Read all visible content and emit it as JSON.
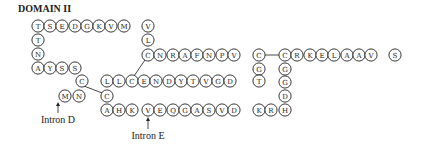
{
  "title": "DOMAIN II",
  "radius": 6.1,
  "residues": [
    {
      "aa": "T",
      "x": 38,
      "y": 26
    },
    {
      "aa": "S",
      "x": 50,
      "y": 26
    },
    {
      "aa": "E",
      "x": 62,
      "y": 26
    },
    {
      "aa": "D",
      "x": 75,
      "y": 26
    },
    {
      "aa": "G",
      "x": 87,
      "y": 26
    },
    {
      "aa": "K",
      "x": 99,
      "y": 26
    },
    {
      "aa": "V",
      "x": 111,
      "y": 26
    },
    {
      "aa": "M",
      "x": 124,
      "y": 26
    },
    {
      "aa": "V",
      "x": 148,
      "y": 26
    },
    {
      "aa": "T",
      "x": 38,
      "y": 40
    },
    {
      "aa": "N",
      "x": 38,
      "y": 54
    },
    {
      "aa": "A",
      "x": 38,
      "y": 68
    },
    {
      "aa": "Y",
      "x": 50,
      "y": 68
    },
    {
      "aa": "S",
      "x": 62,
      "y": 68
    },
    {
      "aa": "S",
      "x": 75,
      "y": 68
    },
    {
      "aa": "C",
      "x": 82,
      "y": 81
    },
    {
      "aa": "M",
      "x": 65,
      "y": 96
    },
    {
      "aa": "N",
      "x": 79,
      "y": 96
    },
    {
      "aa": "C",
      "x": 107,
      "y": 96
    },
    {
      "aa": "L",
      "x": 148,
      "y": 40
    },
    {
      "aa": "C",
      "x": 148,
      "y": 55
    },
    {
      "aa": "N",
      "x": 160,
      "y": 55
    },
    {
      "aa": "R",
      "x": 173,
      "y": 55
    },
    {
      "aa": "A",
      "x": 185,
      "y": 55
    },
    {
      "aa": "F",
      "x": 197,
      "y": 55
    },
    {
      "aa": "N",
      "x": 209,
      "y": 55
    },
    {
      "aa": "P",
      "x": 222,
      "y": 55
    },
    {
      "aa": "V",
      "x": 234,
      "y": 55
    },
    {
      "aa": "C",
      "x": 259,
      "y": 55
    },
    {
      "aa": "G",
      "x": 259,
      "y": 69
    },
    {
      "aa": "L",
      "x": 107,
      "y": 81
    },
    {
      "aa": "L",
      "x": 119,
      "y": 81
    },
    {
      "aa": "C",
      "x": 132,
      "y": 81
    },
    {
      "aa": "E",
      "x": 144,
      "y": 81
    },
    {
      "aa": "N",
      "x": 156,
      "y": 81
    },
    {
      "aa": "D",
      "x": 169,
      "y": 81
    },
    {
      "aa": "Y",
      "x": 181,
      "y": 81
    },
    {
      "aa": "T",
      "x": 193,
      "y": 81
    },
    {
      "aa": "V",
      "x": 206,
      "y": 81
    },
    {
      "aa": "G",
      "x": 218,
      "y": 81
    },
    {
      "aa": "D",
      "x": 230,
      "y": 81
    },
    {
      "aa": "T",
      "x": 259,
      "y": 81
    },
    {
      "aa": "A",
      "x": 107,
      "y": 110
    },
    {
      "aa": "H",
      "x": 119,
      "y": 110
    },
    {
      "aa": "K",
      "x": 132,
      "y": 110
    },
    {
      "aa": "V",
      "x": 148,
      "y": 110
    },
    {
      "aa": "E",
      "x": 160,
      "y": 110
    },
    {
      "aa": "Q",
      "x": 173,
      "y": 110
    },
    {
      "aa": "G",
      "x": 185,
      "y": 110
    },
    {
      "aa": "A",
      "x": 197,
      "y": 110
    },
    {
      "aa": "S",
      "x": 209,
      "y": 110
    },
    {
      "aa": "V",
      "x": 222,
      "y": 110
    },
    {
      "aa": "D",
      "x": 234,
      "y": 110
    },
    {
      "aa": "K",
      "x": 259,
      "y": 110
    },
    {
      "aa": "R",
      "x": 271,
      "y": 110
    },
    {
      "aa": "H",
      "x": 285,
      "y": 110
    },
    {
      "aa": "D",
      "x": 285,
      "y": 96
    },
    {
      "aa": "G",
      "x": 285,
      "y": 82
    },
    {
      "aa": "G",
      "x": 285,
      "y": 69
    },
    {
      "aa": "C",
      "x": 285,
      "y": 55
    },
    {
      "aa": "R",
      "x": 297,
      "y": 55
    },
    {
      "aa": "K",
      "x": 310,
      "y": 55
    },
    {
      "aa": "E",
      "x": 322,
      "y": 55
    },
    {
      "aa": "L",
      "x": 334,
      "y": 55
    },
    {
      "aa": "A",
      "x": 347,
      "y": 55
    },
    {
      "aa": "A",
      "x": 359,
      "y": 55
    },
    {
      "aa": "V",
      "x": 371,
      "y": 55
    },
    {
      "aa": "S",
      "x": 395,
      "y": 55
    }
  ],
  "links": [
    {
      "x1": 84,
      "y1": 86,
      "x2": 102,
      "y2": 93
    },
    {
      "x1": 145,
      "y1": 60,
      "x2": 134,
      "y2": 76
    },
    {
      "x1": 265,
      "y1": 55,
      "x2": 279,
      "y2": 55
    }
  ],
  "annotations": [
    {
      "label": "Intron D",
      "x": 58,
      "y": 123,
      "arrow_x": 58,
      "arrow_y1": 113,
      "arrow_y2": 102
    },
    {
      "label": "Intron E",
      "x": 148,
      "y": 139,
      "arrow_x": 148,
      "arrow_y1": 129,
      "arrow_y2": 117
    }
  ]
}
